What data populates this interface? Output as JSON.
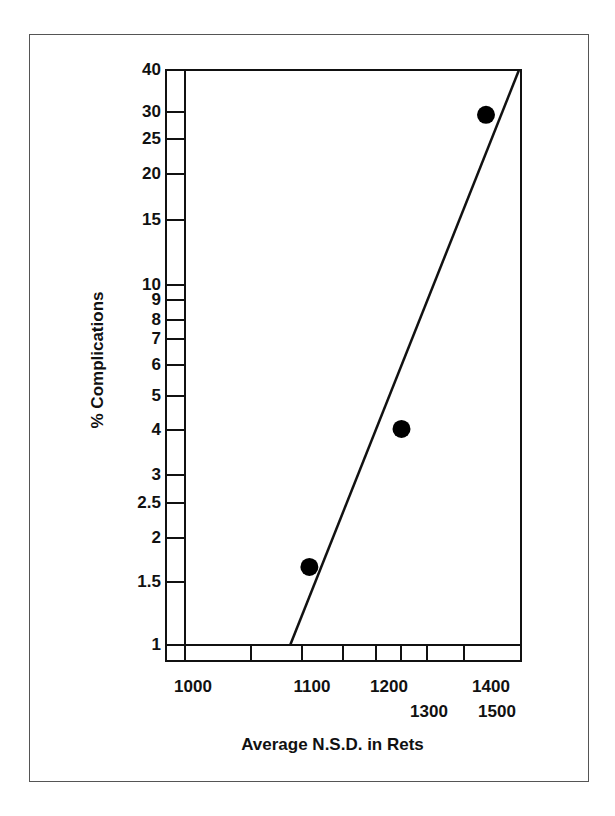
{
  "chart_data": {
    "type": "scatter",
    "title": "",
    "xlabel": "Average N.S.D. in Rets",
    "ylabel": "% Complications",
    "x_scale": "nonlinear (reciprocal-type)",
    "y_scale": "log",
    "xlim": [
      1000,
      1500
    ],
    "ylim": [
      1,
      40
    ],
    "grid": false,
    "legend": null,
    "y_ticks": [
      {
        "label": "40",
        "value": 40,
        "y": 70
      },
      {
        "label": "30",
        "value": 30,
        "y": 112
      },
      {
        "label": "25",
        "value": 25,
        "y": 139
      },
      {
        "label": "20",
        "value": 20,
        "y": 174
      },
      {
        "label": "15",
        "value": 15,
        "y": 220
      },
      {
        "label": "10",
        "value": 10,
        "y": 285
      },
      {
        "label": "9",
        "value": 9,
        "y": 300
      },
      {
        "label": "8",
        "value": 8,
        "y": 320
      },
      {
        "label": "7",
        "value": 7,
        "y": 339
      },
      {
        "label": "6",
        "value": 6,
        "y": 365
      },
      {
        "label": "5",
        "value": 5,
        "y": 396
      },
      {
        "label": "4",
        "value": 4,
        "y": 430
      },
      {
        "label": "3",
        "value": 3,
        "y": 475
      },
      {
        "label": "2.5",
        "value": 2.5,
        "y": 503
      },
      {
        "label": "2",
        "value": 2,
        "y": 538
      },
      {
        "label": "1.5",
        "value": 1.5,
        "y": 582
      },
      {
        "label": "1",
        "value": 1,
        "y": 645
      }
    ],
    "x_ticks": [
      {
        "label": "1000",
        "value": 1000,
        "x": 184,
        "label_x": 193,
        "row": 1
      },
      {
        "label": "1100",
        "value": 1100,
        "x": 302,
        "label_x": 312,
        "row": 1
      },
      {
        "label": "1200",
        "value": 1200,
        "x": 376,
        "label_x": 389,
        "row": 1
      },
      {
        "label": "1300",
        "value": 1300,
        "x": 427,
        "label_x": 429,
        "row": 2
      },
      {
        "label": "1400",
        "value": 1400,
        "x": 464,
        "label_x": 491,
        "row": 1
      },
      {
        "label": "1500",
        "value": 1500,
        "x": 519,
        "label_x": 497,
        "row": 2
      }
    ],
    "x_minor_ticks": [
      251,
      343,
      401
    ],
    "points": [
      {
        "x": 1110,
        "y": 1.65
      },
      {
        "x": 1250,
        "y": 4.0
      },
      {
        "x": 1440,
        "y": 30
      }
    ],
    "trend_line": {
      "from": {
        "x": 1090,
        "y": 1.0
      },
      "to": {
        "x": 1500,
        "y": 40
      }
    }
  }
}
